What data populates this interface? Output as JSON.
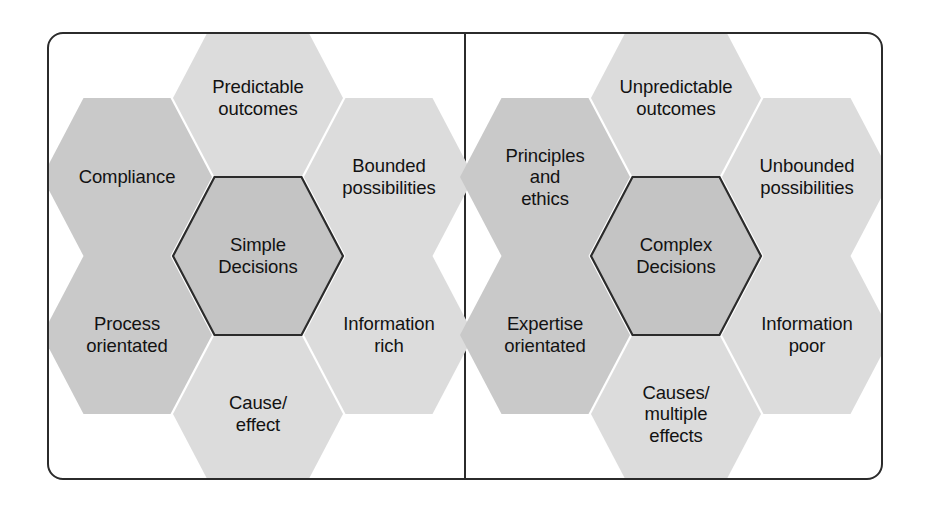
{
  "figure": {
    "type": "comparison-hexagon-diagram",
    "frame": {
      "border_color": "#2b2b2b",
      "divider": true
    },
    "colors": {
      "hex_light": "#dcdcdc",
      "hex_medium": "#c9c9c9",
      "hex_center": "#c4c4c4",
      "center_border": "#2b2b2b",
      "text": "#121212"
    }
  },
  "panels": [
    {
      "id": "simple-decisions",
      "center": {
        "label": "Simple\nDecisions",
        "tone": "center"
      },
      "satellites": [
        {
          "position": "top",
          "label": "Predictable\noutcomes",
          "tone": "light"
        },
        {
          "position": "top-right",
          "label": "Bounded\npossibilities",
          "tone": "light"
        },
        {
          "position": "bottom-right",
          "label": "Information\nrich",
          "tone": "light"
        },
        {
          "position": "bottom",
          "label": "Cause/\neffect",
          "tone": "light"
        },
        {
          "position": "bottom-left",
          "label": "Process\norientated",
          "tone": "medium"
        },
        {
          "position": "top-left",
          "label": "Compliance",
          "tone": "medium"
        }
      ]
    },
    {
      "id": "complex-decisions",
      "center": {
        "label": "Complex\nDecisions",
        "tone": "center"
      },
      "satellites": [
        {
          "position": "top",
          "label": "Unpredictable\noutcomes",
          "tone": "light"
        },
        {
          "position": "top-right",
          "label": "Unbounded\npossibilities",
          "tone": "light"
        },
        {
          "position": "bottom-right",
          "label": "Information\npoor",
          "tone": "light"
        },
        {
          "position": "bottom",
          "label": "Causes/\nmultiple\neffects",
          "tone": "light"
        },
        {
          "position": "bottom-left",
          "label": "Expertise\norientated",
          "tone": "medium"
        },
        {
          "position": "top-left",
          "label": "Principles\nand\nethics",
          "tone": "medium"
        }
      ]
    }
  ]
}
